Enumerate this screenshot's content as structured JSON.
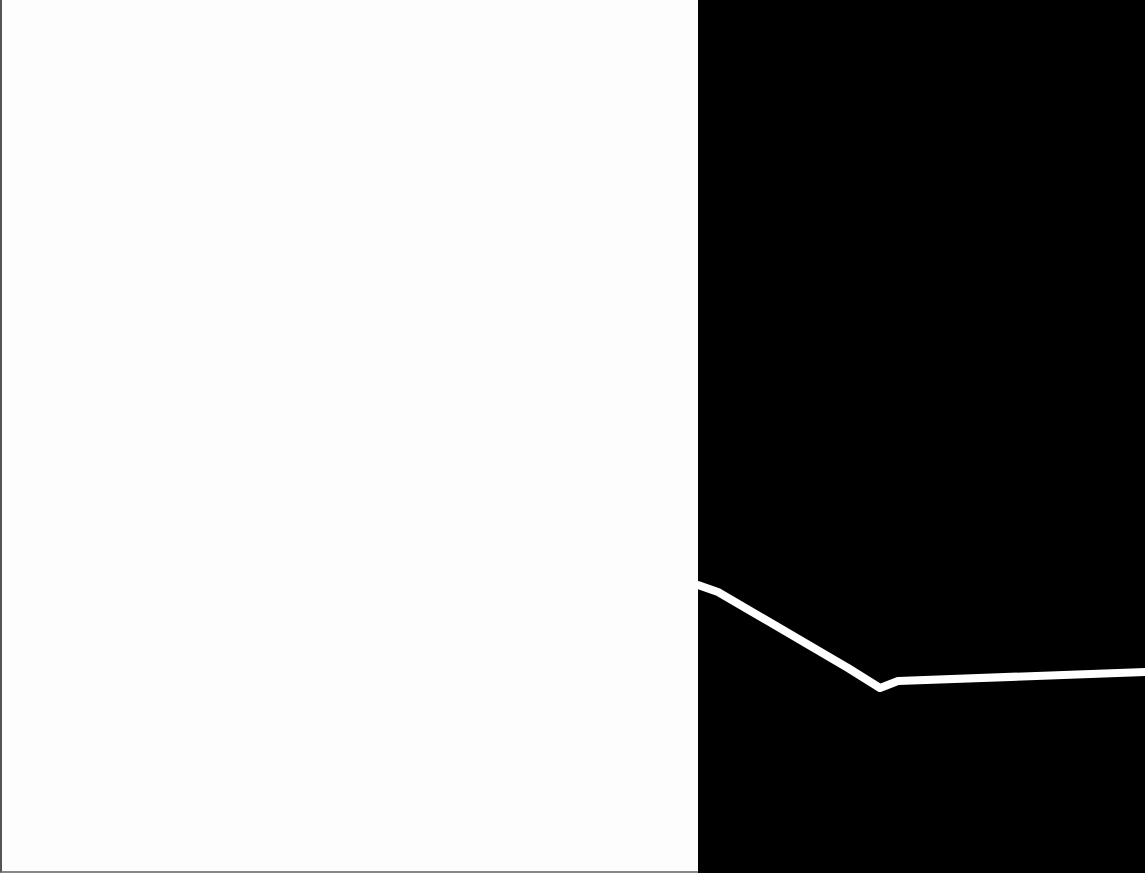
{
  "scene": {
    "left_panel": {
      "color": "#fdfdfd"
    },
    "right_panel": {
      "color": "#000000"
    },
    "stroke": {
      "color": "#ffffff",
      "points": [
        [
          0,
          585
        ],
        [
          20,
          592
        ],
        [
          150,
          668
        ],
        [
          182,
          688
        ],
        [
          200,
          681
        ],
        [
          447,
          672
        ]
      ],
      "width": 8
    }
  }
}
